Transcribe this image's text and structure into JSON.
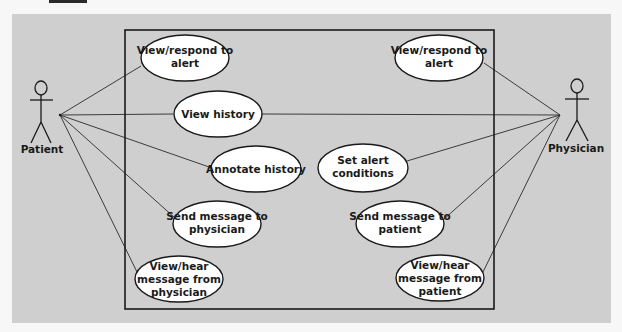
{
  "diagram": {
    "type": "UML use case diagram",
    "colors": {
      "background": "#cfcfcf",
      "page": "#f7f7f7",
      "stroke": "#1a1a1a",
      "usecase_fill": "#ffffff"
    },
    "actors": [
      {
        "id": "patient",
        "label": "Patient"
      },
      {
        "id": "physician",
        "label": "Physician"
      }
    ],
    "use_cases": [
      {
        "id": "uc1",
        "lines": [
          "View/respond to",
          "alert"
        ],
        "actor": "patient"
      },
      {
        "id": "uc2",
        "lines": [
          "View history"
        ],
        "actor": "both"
      },
      {
        "id": "uc3",
        "lines": [
          "Annotate history"
        ],
        "actor": "patient"
      },
      {
        "id": "uc4",
        "lines": [
          "Send message to",
          "physician"
        ],
        "actor": "patient"
      },
      {
        "id": "uc5",
        "lines": [
          "View/hear",
          "message from",
          "physician"
        ],
        "actor": "patient"
      },
      {
        "id": "uc6",
        "lines": [
          "View/respond to",
          "alert"
        ],
        "actor": "physician"
      },
      {
        "id": "uc7",
        "lines": [
          "Set alert",
          "conditions"
        ],
        "actor": "physician"
      },
      {
        "id": "uc8",
        "lines": [
          "Send message to",
          "patient"
        ],
        "actor": "physician"
      },
      {
        "id": "uc9",
        "lines": [
          "View/hear",
          "message from",
          "patient"
        ],
        "actor": "physician"
      }
    ]
  }
}
